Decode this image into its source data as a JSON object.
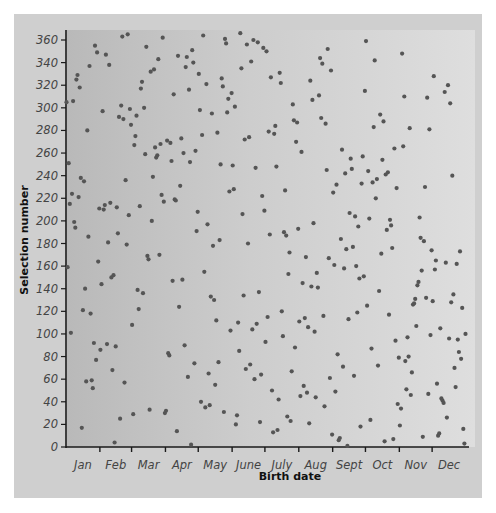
{
  "chart_data": {
    "type": "scatter",
    "title": "",
    "xlabel": "Birth date",
    "ylabel": "Selection number",
    "ylim": [
      0,
      366
    ],
    "yticks": [
      0,
      20,
      40,
      60,
      80,
      100,
      120,
      140,
      160,
      180,
      200,
      220,
      240,
      260,
      280,
      300,
      320,
      340,
      360
    ],
    "xtick_labels": [
      "Jan",
      "Feb",
      "Mar",
      "Apr",
      "May",
      "June",
      "July",
      "Aug",
      "Sept",
      "Oct",
      "Nov",
      "Dec"
    ],
    "month_lengths": [
      31,
      29,
      31,
      30,
      31,
      30,
      31,
      31,
      30,
      31,
      30,
      31
    ],
    "grid": false,
    "legend": "none",
    "marker_color": "#555555",
    "series": [
      {
        "name": "Selection number by day of year",
        "values": [
          305,
          159,
          251,
          215,
          101,
          224,
          306,
          199,
          194,
          325,
          329,
          221,
          318,
          238,
          17,
          121,
          235,
          140,
          58,
          280,
          186,
          337,
          118,
          59,
          52,
          92,
          355,
          77,
          349,
          164,
          211,
          86,
          144,
          297,
          210,
          214,
          347,
          91,
          181,
          338,
          216,
          150,
          68,
          152,
          4,
          89,
          212,
          189,
          292,
          25,
          302,
          363,
          290,
          57,
          236,
          179,
          365,
          205,
          299,
          285,
          108,
          29,
          267,
          275,
          293,
          139,
          122,
          213,
          317,
          323,
          136,
          300,
          259,
          354,
          169,
          166,
          33,
          332,
          200,
          239,
          334,
          265,
          256,
          258,
          343,
          170,
          268,
          223,
          362,
          217,
          30,
          32,
          271,
          83,
          81,
          269,
          253,
          147,
          312,
          219,
          218,
          14,
          346,
          124,
          231,
          273,
          148,
          260,
          90,
          336,
          345,
          62,
          316,
          252,
          2,
          351,
          340,
          74,
          262,
          191,
          208,
          330,
          298,
          40,
          276,
          364,
          155,
          35,
          321,
          197,
          65,
          37,
          133,
          295,
          178,
          130,
          55,
          112,
          278,
          75,
          183,
          250,
          326,
          319,
          31,
          361,
          357,
          296,
          308,
          226,
          103,
          313,
          249,
          228,
          301,
          20,
          28,
          110,
          85,
          366,
          335,
          206,
          134,
          272,
          69,
          356,
          180,
          274,
          73,
          341,
          104,
          360,
          60,
          247,
          109,
          358,
          137,
          22,
          64,
          222,
          353,
          209,
          93,
          350,
          115,
          279,
          188,
          327,
          50,
          13,
          277,
          284,
          248,
          15,
          42,
          331,
          322,
          120,
          98,
          190,
          227,
          187,
          27,
          153,
          172,
          23,
          67,
          303,
          289,
          88,
          270,
          287,
          193,
          111,
          45,
          261,
          145,
          54,
          114,
          168,
          48,
          106,
          21,
          324,
          142,
          307,
          198,
          102,
          44,
          154,
          141,
          311,
          344,
          291,
          339,
          116,
          36,
          286,
          245,
          352,
          167,
          61,
          333,
          11,
          225,
          161,
          49,
          232,
          82,
          6,
          8,
          184,
          263,
          71,
          158,
          242,
          175,
          1,
          113,
          207,
          255,
          246,
          177,
          63,
          204,
          160,
          119,
          195,
          149,
          18,
          233,
          257,
          151,
          315,
          359,
          125,
          244,
          202,
          24,
          87,
          234,
          283,
          342,
          220,
          237,
          72,
          138,
          294,
          171,
          254,
          288,
          5,
          241,
          192,
          243,
          117,
          201,
          196,
          176,
          7,
          264,
          94,
          229,
          38,
          79,
          19,
          34,
          348,
          266,
          310,
          76,
          51,
          97,
          80,
          282,
          46,
          66,
          126,
          127,
          131,
          107,
          143,
          146,
          203,
          185,
          156,
          9,
          182,
          230,
          132,
          309,
          47,
          281,
          99,
          174,
          129,
          328,
          157,
          165,
          56,
          10,
          12,
          105,
          43,
          41,
          39,
          314,
          163,
          26,
          320,
          96,
          304,
          128,
          240,
          135,
          70,
          53,
          162,
          95,
          84,
          173,
          78,
          123,
          16,
          3,
          100
        ]
      }
    ]
  },
  "axes": {
    "ylabel": "Selection number",
    "xlabel": "Birth date"
  }
}
